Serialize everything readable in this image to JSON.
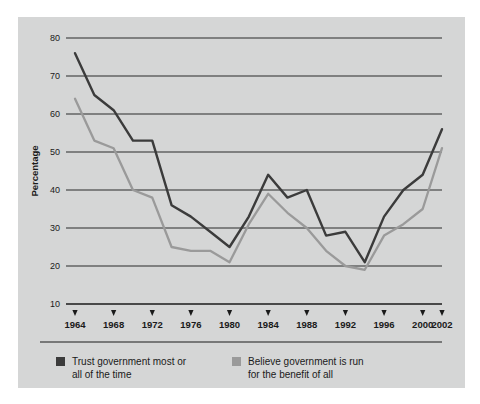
{
  "chart_data": {
    "type": "line",
    "title": "",
    "xlabel": "",
    "ylabel": "Percentage",
    "ylim": [
      10,
      80
    ],
    "ytick_values": [
      10,
      20,
      30,
      40,
      50,
      60,
      70,
      80
    ],
    "ytick_labels": [
      "10",
      "20",
      "30",
      "40",
      "50",
      "60",
      "70",
      "80"
    ],
    "xlim": [
      1964,
      2002
    ],
    "xtick_values": [
      1964,
      1968,
      1972,
      1976,
      1980,
      1984,
      1988,
      1992,
      1996,
      2000,
      2002
    ],
    "xtick_labels": [
      "1964",
      "1968",
      "1972",
      "1976",
      "1980",
      "1984",
      "1988",
      "1992",
      "1996",
      "2000",
      "2002"
    ],
    "grid": "horizontal",
    "legend_position": "bottom",
    "x": [
      1964,
      1966,
      1968,
      1970,
      1972,
      1974,
      1976,
      1978,
      1980,
      1982,
      1984,
      1986,
      1988,
      1990,
      1992,
      1994,
      1996,
      1998,
      2000,
      2002
    ],
    "series": [
      {
        "name": "Trust government most or all of the time",
        "color": "#3b3b3b",
        "values": [
          76,
          65,
          61,
          53,
          53,
          36,
          33,
          29,
          25,
          33,
          44,
          38,
          40,
          28,
          29,
          21,
          33,
          40,
          44,
          56
        ]
      },
      {
        "name": "Believe government is run for the benefit of all",
        "color": "#9a9a9a",
        "values": [
          64,
          53,
          51,
          40,
          38,
          25,
          24,
          24,
          21,
          31,
          39,
          34,
          30,
          24,
          20,
          19,
          28,
          31,
          35,
          51
        ]
      }
    ]
  },
  "legend": {
    "items": [
      {
        "swatch_color": "#3b3b3b",
        "line1": "Trust government most or",
        "line2": "all of the time"
      },
      {
        "swatch_color": "#9a9a9a",
        "line1": "Believe government is run",
        "line2": "for the benefit of all"
      }
    ]
  },
  "colors": {
    "panel_background": "#d5d6d6",
    "page_background": "#ffffff",
    "axis": "#1a1a1a",
    "gridline": "#2a2a2a",
    "series_dark": "#3b3b3b",
    "series_light": "#9a9a9a"
  }
}
